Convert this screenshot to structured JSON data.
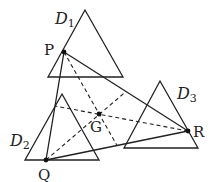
{
  "diagram": {
    "triangles": [
      {
        "name": "D1",
        "label": "D",
        "sub": "1",
        "apex": [
          85,
          10
        ],
        "left": [
          48,
          77
        ],
        "right": [
          123,
          77
        ]
      },
      {
        "name": "D2",
        "label": "D",
        "sub": "2",
        "apex": [
          62,
          94
        ],
        "left": [
          25,
          160
        ],
        "right": [
          99,
          160
        ]
      },
      {
        "name": "D3",
        "label": "D",
        "sub": "3",
        "apex": [
          160,
          81
        ],
        "left": [
          124,
          148
        ],
        "right": [
          198,
          148
        ]
      }
    ],
    "points": {
      "P": {
        "label": "P",
        "x": 64,
        "y": 52
      },
      "Q": {
        "label": "Q",
        "x": 46,
        "y": 160
      },
      "R": {
        "label": "R",
        "x": 188,
        "y": 131
      },
      "G": {
        "label": "G",
        "x": 99,
        "y": 114
      }
    },
    "colors": {
      "stroke": "#222222",
      "background": "#ffffff"
    }
  }
}
